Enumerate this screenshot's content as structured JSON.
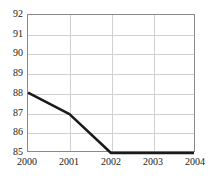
{
  "chart_data": {
    "type": "line",
    "title": "",
    "subtitle": "",
    "xlabel": "",
    "ylabel": "",
    "x": [
      2000,
      2001,
      2002,
      2003,
      2004
    ],
    "categories": [
      "2000",
      "2001",
      "2002",
      "2003",
      "2004"
    ],
    "series": [
      {
        "name": "series-1",
        "values": [
          88.0,
          86.9,
          84.9,
          84.9,
          84.9
        ],
        "color": "#1a1a1a",
        "line_width": 2.6
      }
    ],
    "xlim": [
      2000,
      2004
    ],
    "ylim": [
      85,
      92
    ],
    "ytick_labels": [
      "92",
      "91",
      "90",
      "89",
      "88",
      "87",
      "86",
      "85"
    ],
    "ytick_values": [
      92,
      91,
      90,
      89,
      88,
      87,
      86,
      85
    ],
    "xtick_labels": [
      "2000",
      "2001",
      "2002",
      "2003",
      "2004"
    ],
    "xtick_values": [
      2000,
      2001,
      2002,
      2003,
      2004
    ],
    "grid": true,
    "grid_color": "#d0d0d0",
    "frame_color": "#8a8a8a",
    "legend": null,
    "legend_position": "none",
    "annotations": [],
    "background": "#ffffff"
  }
}
